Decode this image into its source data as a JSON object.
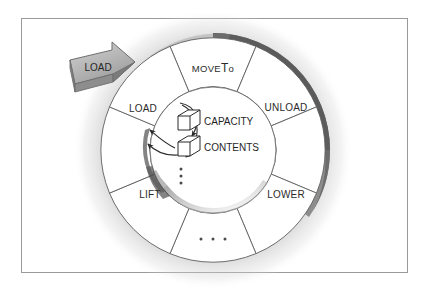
{
  "figure": {
    "frame_color": "#9a9a9a",
    "background": "#ffffff",
    "ink_color": "#2b2b2b",
    "ring_shadow_color": "#585858",
    "arrow_fill": "#b8b8b8",
    "arrow_edge": "#6e6e6e"
  },
  "callout": {
    "label": "LOAD",
    "name": "load-callout-arrow"
  },
  "ring": {
    "center_x": 213,
    "center_y": 150,
    "outer_radius": 112,
    "inner_radius": 63,
    "segment_count": 8,
    "segments": [
      {
        "id": "moveto",
        "label": "MOVETO",
        "label_main": "MOVE",
        "label_cap": "T",
        "label_tail": "o",
        "label_x": 213,
        "label_y": 68,
        "empty": false
      },
      {
        "id": "unload",
        "label": "UNLOAD",
        "label_x": 286,
        "label_y": 107,
        "empty": false
      },
      {
        "id": "lower",
        "label": "LOWER",
        "label_x": 286,
        "label_y": 194,
        "empty": false
      },
      {
        "id": "blank-bottom-right",
        "label": "",
        "label_x": 246,
        "label_y": 243,
        "empty": true
      },
      {
        "id": "ellipsis-bottom",
        "label": "",
        "label_x": 213,
        "label_y": 240,
        "empty": true
      },
      {
        "id": "lift",
        "label": "LIFT",
        "label_x": 150,
        "label_y": 194,
        "empty": false
      },
      {
        "id": "load",
        "label": "LOAD",
        "label_x": 143,
        "label_y": 108,
        "empty": false
      },
      {
        "id": "blank-top-left",
        "label": "",
        "label_x": 172,
        "label_y": 62,
        "empty": true
      }
    ]
  },
  "core": {
    "name": "attributes-core",
    "attributes": [
      {
        "id": "capacity",
        "label": "CAPACITY",
        "icon": "cube-icon",
        "icon_x": 185,
        "icon_y": 120,
        "label_x": 204,
        "label_y": 121
      },
      {
        "id": "contents",
        "label": "CONTENTS",
        "icon": "cube-icon",
        "icon_x": 185,
        "icon_y": 146,
        "label_x": 204,
        "label_y": 147
      }
    ],
    "ellipsis_vertical": {
      "id": "attr-ellipsis",
      "dots": 3,
      "x": 181,
      "y": 176
    }
  },
  "bottom_ellipsis": {
    "id": "segment-ellipsis",
    "dots": 3,
    "x": 213,
    "y": 239
  }
}
